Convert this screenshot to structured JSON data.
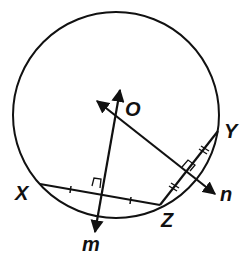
{
  "diagram": {
    "title": "",
    "circle": {
      "center_label": "O"
    },
    "points": {
      "X": "X",
      "Y": "Y",
      "Z": "Z"
    },
    "lines": {
      "m": "m",
      "n": "n"
    },
    "colors": {
      "stroke": "#111111",
      "background": "#ffffff"
    }
  }
}
